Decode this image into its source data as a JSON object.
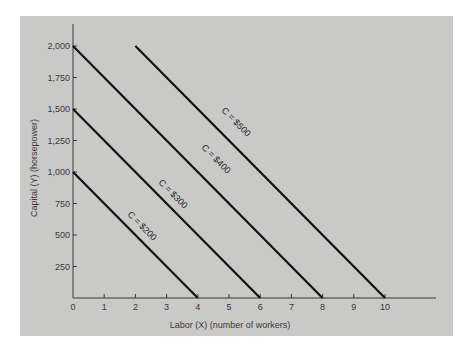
{
  "chart_data": {
    "type": "line",
    "title": "",
    "xlabel": "Labor (X) (number of workers)",
    "ylabel": "Capital (Y) (horsepower)",
    "xlim": [
      0,
      11.5
    ],
    "ylim": [
      0,
      2200
    ],
    "x_ticks": [
      0,
      1,
      2,
      3,
      4,
      5,
      6,
      7,
      8,
      9,
      10
    ],
    "x_tick_labels": [
      "0",
      "1",
      "2",
      "3",
      "4",
      "5",
      "6",
      "7",
      "8",
      "9",
      "10"
    ],
    "y_ticks": [
      250,
      500,
      750,
      1000,
      1250,
      1500,
      1750,
      2000
    ],
    "y_tick_labels": [
      "250",
      "500",
      "750",
      "1,000",
      "1,250",
      "1,500",
      "1,750",
      "2,000"
    ],
    "grid": false,
    "legend": "none (inline labels on lines)",
    "series": [
      {
        "name": "C = $200",
        "label": "C = $200",
        "points": [
          [
            0,
            1000
          ],
          [
            4,
            0
          ]
        ]
      },
      {
        "name": "C = $300",
        "label": "C = $300",
        "points": [
          [
            0,
            1500
          ],
          [
            6,
            0
          ]
        ]
      },
      {
        "name": "C = $400",
        "label": "C = $400",
        "points": [
          [
            0,
            2000
          ],
          [
            8,
            0
          ]
        ]
      },
      {
        "name": "C = $500",
        "label": "C = $500",
        "points": [
          [
            2,
            2000
          ],
          [
            10,
            0
          ]
        ]
      }
    ],
    "colors": {
      "background": "#c9c9c8",
      "line": "#111111",
      "axis": "#3a3a3a",
      "text": "#3a3a3a"
    }
  }
}
